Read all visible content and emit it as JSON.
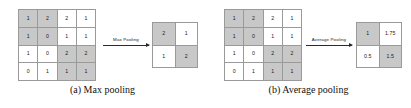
{
  "figure": {
    "panels": [
      {
        "id": "max-pooling",
        "caption": "(a) Max pooling",
        "arrow_label": "Max Pooling",
        "input": {
          "rows": [
            [
              "1",
              "2",
              "2",
              "1"
            ],
            [
              "1",
              "0",
              "1",
              "1"
            ],
            [
              "1",
              "0",
              "2",
              "2"
            ],
            [
              "0",
              "1",
              "1",
              "1"
            ]
          ],
          "shaded": [
            [
              true,
              true,
              false,
              false
            ],
            [
              true,
              true,
              false,
              false
            ],
            [
              false,
              false,
              true,
              true
            ],
            [
              false,
              false,
              true,
              true
            ]
          ]
        },
        "output": {
          "rows": [
            [
              "2",
              "1"
            ],
            [
              "1",
              "2"
            ]
          ],
          "shaded": [
            [
              true,
              false
            ],
            [
              false,
              true
            ]
          ]
        }
      },
      {
        "id": "average-pooling",
        "caption": "(b) Average pooling",
        "arrow_label": "Average Pooling",
        "input": {
          "rows": [
            [
              "1",
              "2",
              "2",
              "1"
            ],
            [
              "1",
              "0",
              "1",
              "1"
            ],
            [
              "1",
              "0",
              "2",
              "2"
            ],
            [
              "0",
              "1",
              "1",
              "1"
            ]
          ],
          "shaded": [
            [
              true,
              true,
              false,
              false
            ],
            [
              true,
              true,
              false,
              false
            ],
            [
              false,
              false,
              true,
              true
            ],
            [
              false,
              false,
              true,
              true
            ]
          ]
        },
        "output": {
          "rows": [
            [
              "1",
              "1.75"
            ],
            [
              "0.5",
              "1.5"
            ]
          ],
          "shaded": [
            [
              true,
              false
            ],
            [
              false,
              true
            ]
          ]
        }
      }
    ],
    "colors": {
      "shaded_cell": "#c8c8c8",
      "plain_cell": "#ffffff",
      "grid_line": "#9a9a9a",
      "arrow": "#2a2a2a",
      "text": "#1a1a1a"
    }
  }
}
